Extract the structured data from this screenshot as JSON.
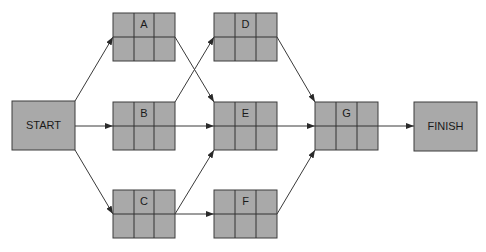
{
  "diagram": {
    "type": "activity-on-node network",
    "colors": {
      "node_fill": "#a9a9a9",
      "node_border": "#3c3c3c",
      "edge": "#3a3a3a",
      "text": "#1a1a1a"
    },
    "terminals": {
      "start": {
        "label": "START",
        "x": 12,
        "y": 101,
        "w": 63,
        "h": 49
      },
      "finish": {
        "label": "FINISH",
        "x": 414,
        "y": 102,
        "w": 63,
        "h": 49
      }
    },
    "activities": {
      "A": {
        "label": "A",
        "x": 113,
        "y": 13,
        "w": 62,
        "h": 48
      },
      "B": {
        "label": "B",
        "x": 113,
        "y": 102,
        "w": 62,
        "h": 48
      },
      "C": {
        "label": "C",
        "x": 113,
        "y": 190,
        "w": 62,
        "h": 48
      },
      "D": {
        "label": "D",
        "x": 214,
        "y": 13,
        "w": 63,
        "h": 48
      },
      "E": {
        "label": "E",
        "x": 214,
        "y": 102,
        "w": 63,
        "h": 48
      },
      "F": {
        "label": "F",
        "x": 214,
        "y": 190,
        "w": 63,
        "h": 48
      },
      "G": {
        "label": "G",
        "x": 315,
        "y": 102,
        "w": 63,
        "h": 48
      }
    },
    "edges": [
      {
        "from": "START",
        "to": "A"
      },
      {
        "from": "START",
        "to": "B"
      },
      {
        "from": "START",
        "to": "C"
      },
      {
        "from": "A",
        "to": "E"
      },
      {
        "from": "B",
        "to": "D"
      },
      {
        "from": "B",
        "to": "E"
      },
      {
        "from": "C",
        "to": "E"
      },
      {
        "from": "C",
        "to": "F"
      },
      {
        "from": "D",
        "to": "G"
      },
      {
        "from": "E",
        "to": "G"
      },
      {
        "from": "F",
        "to": "G"
      },
      {
        "from": "G",
        "to": "FINISH"
      }
    ]
  }
}
